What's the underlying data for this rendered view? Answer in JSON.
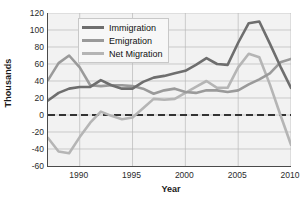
{
  "chart_data": {
    "type": "line",
    "title": "",
    "xlabel": "Year",
    "ylabel": "Thousands",
    "xlim": [
      1987,
      2010
    ],
    "ylim": [
      -60,
      120
    ],
    "xticks": [
      1990,
      1995,
      2000,
      2005,
      2010
    ],
    "yticks": [
      -60,
      -40,
      -20,
      0,
      20,
      40,
      60,
      80,
      100,
      120
    ],
    "grid": true,
    "legend_position": "top-left-inside",
    "zero_line": 0,
    "x": [
      1987,
      1988,
      1989,
      1990,
      1991,
      1992,
      1993,
      1994,
      1995,
      1996,
      1997,
      1998,
      1999,
      2000,
      2001,
      2002,
      2003,
      2004,
      2005,
      2006,
      2007,
      2008,
      2009,
      2010
    ],
    "series": [
      {
        "name": "Immigration",
        "color": "#6e6e6e",
        "values": [
          17,
          26,
          31,
          33,
          33,
          41,
          35,
          31,
          31,
          39,
          44,
          46,
          49,
          52,
          59,
          67,
          60,
          59,
          85,
          108,
          110,
          84,
          57,
          32
        ]
      },
      {
        "name": "Emigration",
        "color": "#9a9a9a",
        "values": [
          41,
          61,
          70,
          56,
          35,
          34,
          35,
          35,
          34,
          31,
          25,
          29,
          31,
          27,
          26,
          29,
          29,
          27,
          29,
          36,
          42,
          49,
          62,
          66
        ]
      },
      {
        "name": "Net Migration",
        "color": "#b5b5b5",
        "values": [
          -27,
          -43,
          -45,
          -26,
          -9,
          4,
          -1,
          -5,
          -3,
          8,
          19,
          18,
          19,
          26,
          33,
          40,
          32,
          32,
          56,
          72,
          68,
          36,
          0,
          -35
        ]
      }
    ]
  },
  "axis": {
    "ylabel": "Thousands",
    "xlabel": "Year",
    "yticks": [
      "120",
      "100",
      "80",
      "60",
      "40",
      "20",
      "0",
      "-20",
      "-40",
      "-60"
    ],
    "xticks": [
      "1990",
      "1995",
      "2000",
      "2005",
      "2010"
    ]
  },
  "legend": {
    "items": [
      {
        "label": "Immigration",
        "color": "#6e6e6e"
      },
      {
        "label": "Emigration",
        "color": "#9a9a9a"
      },
      {
        "label": "Net Migration",
        "color": "#b5b5b5"
      }
    ]
  },
  "colors": {
    "plot_background": "#f2f2f2",
    "grid": "#b9b9b9",
    "axis": "#4a4a4a",
    "zero_line": "#333333",
    "page_background": "#ffffff"
  }
}
